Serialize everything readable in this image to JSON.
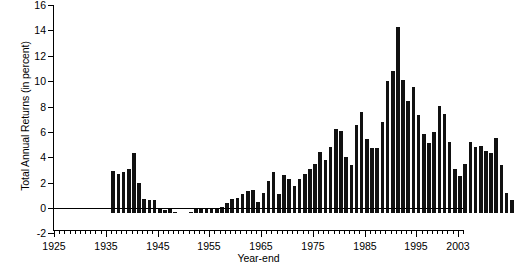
{
  "chart_data": {
    "type": "bar",
    "title": "",
    "subtitle": "",
    "xlabel": "Year-end",
    "ylabel": "Total Annual Returns (in percent)",
    "ylim": [
      -2,
      16
    ],
    "xlim": [
      1925,
      2004
    ],
    "ytick_labels": [
      "16",
      "14",
      "12",
      "10",
      "8",
      "6",
      "4",
      "2",
      "0",
      "-2"
    ],
    "ytick_values": [
      16,
      14,
      12,
      10,
      8,
      6,
      4,
      2,
      0,
      -2
    ],
    "xtick_labels": [
      "1925",
      "1935",
      "1945",
      "1955",
      "1965",
      "1975",
      "1985",
      "1995",
      "2003"
    ],
    "xtick_values": [
      1925,
      1935,
      1945,
      1955,
      1965,
      1975,
      1985,
      1995,
      2003
    ],
    "xtick_minor_step": 1,
    "grid": false,
    "legend": null,
    "bar_color": "#111111",
    "background_color": "#ffffff",
    "categories": [
      1926,
      1927,
      1928,
      1929,
      1930,
      1931,
      1932,
      1933,
      1934,
      1935,
      1936,
      1937,
      1938,
      1939,
      1940,
      1941,
      1942,
      1943,
      1944,
      1945,
      1946,
      1947,
      1948,
      1949,
      1950,
      1951,
      1952,
      1953,
      1954,
      1955,
      1956,
      1957,
      1958,
      1959,
      1960,
      1961,
      1962,
      1963,
      1964,
      1965,
      1966,
      1967,
      1968,
      1969,
      1970,
      1971,
      1972,
      1973,
      1974,
      1975,
      1976,
      1977,
      1978,
      1979,
      1980,
      1981,
      1982,
      1983,
      1984,
      1985,
      1986,
      1987,
      1988,
      1989,
      1990,
      1991,
      1992,
      1993,
      1994,
      1995,
      1996,
      1997,
      1998,
      1999,
      2000,
      2001,
      2002,
      2003
    ],
    "values": [
      3.3,
      3.1,
      3.2,
      3.5,
      4.7,
      2.4,
      1.1,
      1.0,
      1.0,
      0.3,
      0.2,
      0.3,
      0.1,
      0.0,
      0.0,
      0.1,
      0.3,
      0.4,
      0.4,
      0.4,
      0.4,
      0.5,
      0.8,
      1.1,
      1.2,
      1.5,
      1.7,
      1.8,
      0.9,
      1.6,
      2.5,
      3.2,
      1.5,
      3.0,
      2.7,
      2.1,
      2.7,
      3.1,
      3.5,
      3.9,
      4.8,
      4.2,
      5.2,
      6.6,
      6.5,
      4.4,
      3.8,
      6.9,
      8.0,
      5.8,
      5.1,
      5.1,
      7.2,
      10.4,
      11.2,
      14.7,
      10.5,
      8.8,
      9.9,
      7.7,
      6.2,
      5.5,
      6.4,
      8.4,
      7.8,
      5.6,
      3.5,
      2.9,
      3.9,
      5.6,
      5.2,
      5.3,
      4.9,
      4.7,
      5.9,
      3.8,
      1.6,
      1.0
    ]
  }
}
